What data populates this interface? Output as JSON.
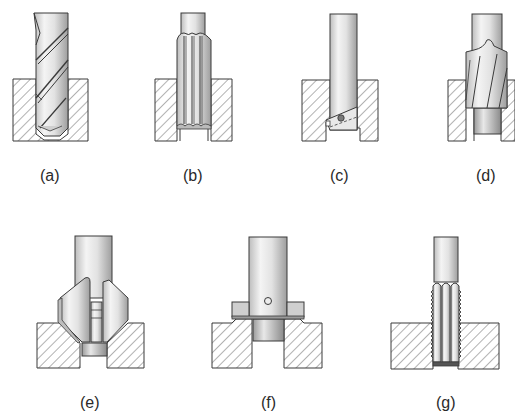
{
  "figure": {
    "panels": [
      {
        "id": "a",
        "label": "(a)",
        "tool": "twist-drill"
      },
      {
        "id": "b",
        "label": "(b)",
        "tool": "reamer"
      },
      {
        "id": "c",
        "label": "(c)",
        "tool": "boring-bar"
      },
      {
        "id": "d",
        "label": "(d)",
        "tool": "counterbore"
      },
      {
        "id": "e",
        "label": "(e)",
        "tool": "countersink"
      },
      {
        "id": "f",
        "label": "(f)",
        "tool": "spot-facer"
      },
      {
        "id": "g",
        "label": "(g)",
        "tool": "tap"
      }
    ]
  },
  "colors": {
    "outline": "#3a3a3a",
    "hatch": "#555555",
    "tool_light": "#f2f2f2",
    "tool_mid": "#d0d0d0",
    "tool_dark": "#a8a8a8",
    "background": "#ffffff"
  }
}
